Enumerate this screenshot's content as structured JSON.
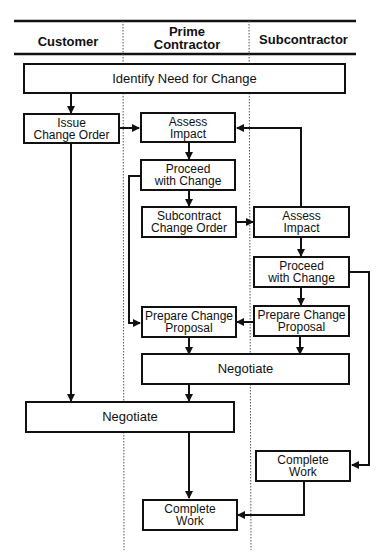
{
  "lanes": [
    {
      "label": "Customer"
    },
    {
      "label": "Prime\nContractor"
    },
    {
      "label": "Subcontractor"
    }
  ],
  "nodes": {
    "identify": "Identify Need for Change",
    "issue_change_order": "Issue\nChange Order",
    "prime_assess": "Assess\nImpact",
    "prime_proceed": "Proceed\nwith Change",
    "subcontract_change_order": "Subcontract\nChange Order",
    "sub_assess": "Assess\nImpact",
    "sub_proceed": "Proceed\nwith Change",
    "prime_prepare": "Prepare Change\nProposal",
    "sub_prepare": "Prepare Change\nProposal",
    "negotiate_prime_sub": "Negotiate",
    "negotiate_customer_prime": "Negotiate",
    "sub_complete": "Complete\nWork",
    "prime_complete": "Complete\nWork"
  }
}
